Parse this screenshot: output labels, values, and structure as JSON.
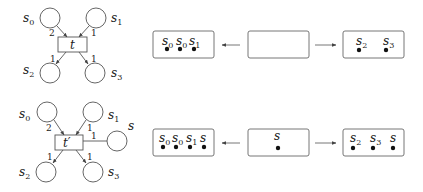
{
  "top": {
    "net": {
      "transition": "t",
      "places": [
        {
          "name": "s",
          "sub": "0",
          "arc_weight": "2"
        },
        {
          "name": "s",
          "sub": "1",
          "arc_weight": "1"
        },
        {
          "name": "s",
          "sub": "2",
          "arc_weight": "1"
        },
        {
          "name": "s",
          "sub": "3",
          "arc_weight": "1"
        }
      ]
    },
    "boxes": [
      {
        "tokens": [
          {
            "name": "s",
            "sub": "0"
          },
          {
            "name": "s",
            "sub": "0"
          },
          {
            "name": "s",
            "sub": "1"
          }
        ]
      },
      {
        "tokens": []
      },
      {
        "tokens": [
          {
            "name": "s",
            "sub": "2"
          },
          {
            "name": "s",
            "sub": "3"
          }
        ]
      }
    ]
  },
  "bottom": {
    "net": {
      "transition": "t′",
      "places": [
        {
          "name": "s",
          "sub": "0",
          "arc_weight": "2"
        },
        {
          "name": "s",
          "sub": "1",
          "arc_weight": "1"
        },
        {
          "name": "s",
          "sub": "2",
          "arc_weight": "1"
        },
        {
          "name": "s",
          "sub": "3",
          "arc_weight": "1"
        },
        {
          "name": "s",
          "sub": "",
          "arc_weight": "1"
        }
      ]
    },
    "boxes": [
      {
        "tokens": [
          {
            "name": "s",
            "sub": "0"
          },
          {
            "name": "s",
            "sub": "0"
          },
          {
            "name": "s",
            "sub": "1"
          },
          {
            "name": "s",
            "sub": ""
          }
        ]
      },
      {
        "tokens": [
          {
            "name": "s",
            "sub": ""
          }
        ]
      },
      {
        "tokens": [
          {
            "name": "s",
            "sub": "2"
          },
          {
            "name": "s",
            "sub": "3"
          },
          {
            "name": "s",
            "sub": ""
          }
        ]
      }
    ]
  },
  "colors": {
    "stroke": "#555555",
    "token": "#111111"
  }
}
